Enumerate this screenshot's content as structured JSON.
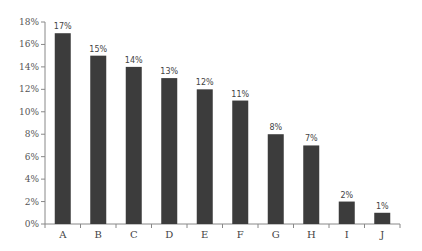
{
  "chart_data": {
    "type": "bar",
    "title": "",
    "xlabel": "",
    "ylabel": "",
    "categories": [
      "A",
      "B",
      "C",
      "D",
      "E",
      "F",
      "G",
      "H",
      "I",
      "J"
    ],
    "values": [
      17,
      15,
      14,
      13,
      12,
      11,
      8,
      7,
      2,
      1
    ],
    "value_labels": [
      "17%",
      "15%",
      "14%",
      "13%",
      "12%",
      "11%",
      "8%",
      "7%",
      "2%",
      "1%"
    ],
    "ylim": [
      0,
      18
    ],
    "y_ticks": [
      0,
      2,
      4,
      6,
      8,
      10,
      12,
      14,
      16,
      18
    ],
    "y_tick_labels": [
      "0%",
      "2%",
      "4%",
      "6%",
      "8%",
      "10%",
      "12%",
      "14%",
      "16%",
      "18%"
    ],
    "grid": false,
    "legend": null,
    "bar_color": "#3c3c3c"
  }
}
